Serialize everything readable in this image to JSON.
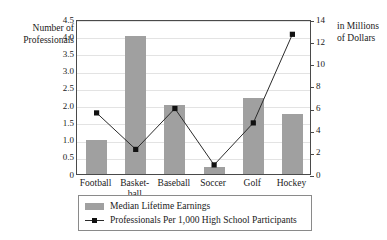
{
  "chart": {
    "title": "Professionals Hired in the U.S. in 2000",
    "left_axis_title_line1": "Number of",
    "left_axis_title_line2": "Professionals",
    "right_axis_title_line1": "in Millions",
    "right_axis_title_line2": "of Dollars",
    "left_ticks": [
      "4.5",
      "4.0",
      "3.5",
      "3.0",
      "2.5",
      "2.0",
      "1.5",
      "1.0",
      "0.5",
      "0"
    ],
    "right_ticks": [
      "14",
      "12",
      "10",
      "8",
      "6",
      "4",
      "2",
      "0"
    ],
    "categories": [
      {
        "line1": "Football",
        "line2": ""
      },
      {
        "line1": "Basket-",
        "line2": "ball"
      },
      {
        "line1": "Baseball",
        "line2": ""
      },
      {
        "line1": "Soccer",
        "line2": ""
      },
      {
        "line1": "Golf",
        "line2": ""
      },
      {
        "line1": "Hockey",
        "line2": ""
      }
    ],
    "legend": {
      "bar_label": "Median Lifetime Earnings",
      "line_label": "Professionals Per 1,000 High School Participants"
    },
    "colors": {
      "bar_fill": "#a0a0a0",
      "line_stroke": "#2b2b2b",
      "marker_fill": "#111111",
      "frame": "#4a4a4a",
      "gridline": "#e3e3e3"
    }
  },
  "chart_data": {
    "type": "bar",
    "title": "Professionals Hired in the U.S. in 2000",
    "xlabel": "",
    "categories": [
      "Football",
      "Basketball",
      "Baseball",
      "Soccer",
      "Golf",
      "Hockey"
    ],
    "grid": true,
    "legend_position": "bottom",
    "series": [
      {
        "name": "Median Lifetime Earnings",
        "type": "bar",
        "axis": "left",
        "ylabel": "Number of Professionals",
        "ylim": [
          0,
          4.5
        ],
        "ytick_step": 0.5,
        "values": [
          1.0,
          4.0,
          2.0,
          0.2,
          2.2,
          1.75
        ]
      },
      {
        "name": "Professionals Per 1,000 High School Participants",
        "type": "line",
        "axis": "right",
        "ylabel": "in Millions of Dollars",
        "ylim": [
          0,
          14
        ],
        "ytick_step": 2,
        "values": [
          5.7,
          2.4,
          6.1,
          1.0,
          4.8,
          12.8
        ]
      }
    ]
  }
}
